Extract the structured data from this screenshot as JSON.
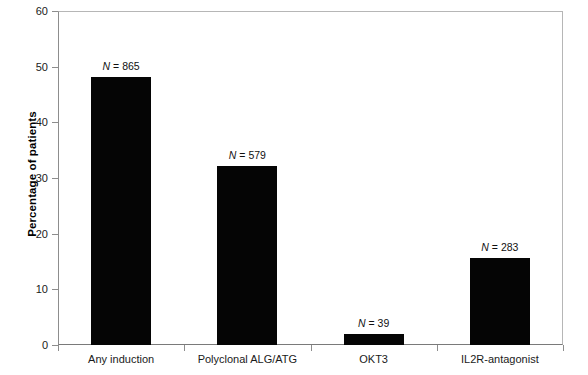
{
  "chart_data": {
    "type": "bar",
    "title": "",
    "xlabel": "",
    "ylabel": "Percentage of patients",
    "ylim": [
      0,
      60
    ],
    "yticks": [
      0,
      10,
      20,
      30,
      40,
      50,
      60
    ],
    "ytick_labels": [
      "0",
      "10",
      "20",
      "30",
      "40",
      "50",
      "60"
    ],
    "grid": false,
    "legend": "none",
    "bar_color": "#050505",
    "categories": [
      "Any induction",
      "Polyclonal ALG/ATG",
      "OKT3",
      "IL2R-antagonist"
    ],
    "values": [
      48.1,
      32.2,
      2.0,
      15.6
    ],
    "annotations": [
      {
        "prefix": "N",
        "eq": " = ",
        "value": "865"
      },
      {
        "prefix": "N",
        "eq": " = ",
        "value": "579"
      },
      {
        "prefix": "N",
        "eq": " = ",
        "value": "39"
      },
      {
        "prefix": "N",
        "eq": " = ",
        "value": "283"
      }
    ]
  },
  "axis": {
    "y_title": "Percentage of patients"
  }
}
